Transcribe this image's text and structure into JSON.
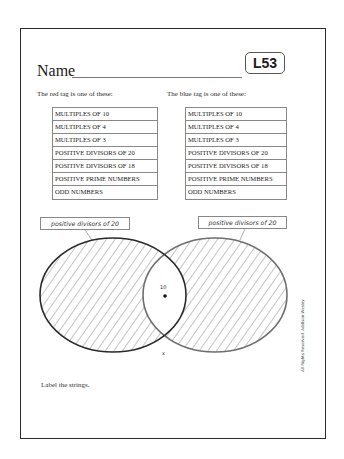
{
  "header": {
    "name_label": "Name",
    "lesson_code": "L53"
  },
  "red_tag": {
    "prompt": "The red tag is one of these:",
    "options": [
      "MULTIPLES OF 10",
      "MULTIPLES OF 4",
      "MULTIPLES OF 3",
      "POSITIVE DIVISORS OF 20",
      "POSITIVE DIVISORS OF 18",
      "POSITIVE PRIME NUMBERS",
      "ODD NUMBERS"
    ]
  },
  "blue_tag": {
    "prompt": "The blue tag is one of these:",
    "options": [
      "MULTIPLES OF 10",
      "MULTIPLES OF 4",
      "MULTIPLES OF 3",
      "POSITIVE DIVISORS OF 20",
      "POSITIVE DIVISORS OF 18",
      "POSITIVE PRIME NUMBERS",
      "ODD NUMBERS"
    ]
  },
  "venn": {
    "left_string_label": "positive divisors of 20",
    "right_string_label": "positive divisors of 20",
    "intersection_point_label": "10",
    "outside_mark": "x",
    "colors": {
      "left_outline": "#2a2a2a",
      "right_outline": "#6e6e6e",
      "hatch": "#555555"
    }
  },
  "instruction": "Label the strings.",
  "copyright": "All Rights Reserved.  Addison-Wesley"
}
